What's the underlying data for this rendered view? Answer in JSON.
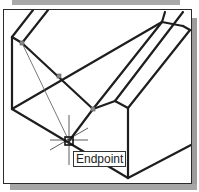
{
  "viewport": {
    "description": "CAD drawing viewport showing isometric solid with object snap",
    "colors": {
      "edge": "#1e1e1e",
      "tracking_line": "#555555",
      "frame": "#2b2b2b",
      "shadow": "#a0a0a0",
      "background": "#ffffff"
    }
  },
  "snap": {
    "tooltip_label": "Endpoint",
    "marker_icon": "endpoint-snap-marker",
    "cursor_icon": "crosshair-cursor"
  }
}
